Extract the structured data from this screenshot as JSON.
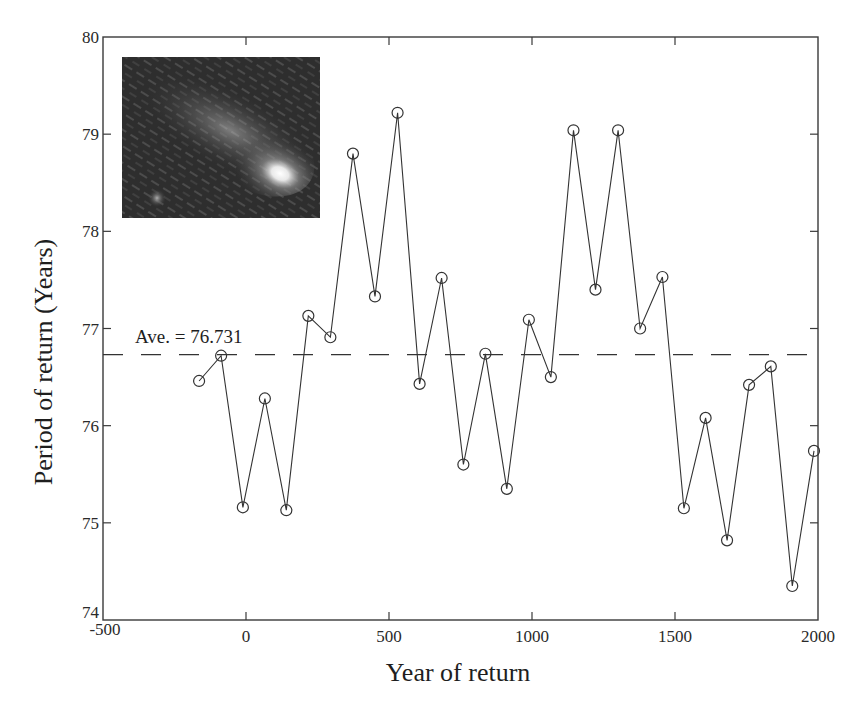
{
  "chart_data": {
    "type": "line",
    "title": "",
    "xlabel": "Year of return",
    "ylabel": "Period of return (Years)",
    "xlim": [
      -500,
      2000
    ],
    "ylim": [
      74,
      80
    ],
    "xticks": [
      -500,
      0,
      500,
      1000,
      1500,
      2000
    ],
    "xtick_labels": [
      "-500",
      "0",
      "500",
      "1000",
      "1500",
      "2000"
    ],
    "yticks": [
      74,
      75,
      76,
      77,
      78,
      79,
      80
    ],
    "ytick_labels": [
      "74",
      "75",
      "76",
      "77",
      "78",
      "79",
      "80"
    ],
    "grid": false,
    "legend": null,
    "marker": "open-circle",
    "series": [
      {
        "name": "Period of return",
        "x": [
          -164,
          -87,
          -11,
          66,
          141,
          218,
          295,
          374,
          451,
          530,
          607,
          684,
          760,
          837,
          912,
          989,
          1066,
          1145,
          1222,
          1301,
          1378,
          1456,
          1531,
          1607,
          1682,
          1759,
          1835,
          1910,
          1986
        ],
        "values": [
          76.46,
          76.72,
          75.16,
          76.28,
          75.13,
          77.13,
          76.91,
          78.8,
          77.33,
          79.22,
          76.43,
          77.52,
          75.6,
          76.74,
          75.35,
          77.09,
          76.5,
          79.04,
          77.4,
          79.04,
          77.0,
          77.53,
          75.15,
          76.08,
          74.82,
          76.42,
          76.61,
          74.35,
          75.74
        ]
      }
    ],
    "reference_lines": [
      {
        "type": "horizontal",
        "y": 76.731,
        "style": "dashed",
        "label": "Ave. = 76.731"
      }
    ],
    "annotations": [
      {
        "text": "Ave. = 76.731",
        "x": -370,
        "y": 76.87
      }
    ],
    "inset_image": {
      "description": "comet-photo",
      "position": "upper-left"
    }
  },
  "labels": {
    "xlabel": "Year of return",
    "ylabel": "Period of return (Years)",
    "average": "Ave. = 76.731"
  },
  "colors": {
    "line": "#333333",
    "axis": "#3a3a3a",
    "background": "#ffffff"
  }
}
